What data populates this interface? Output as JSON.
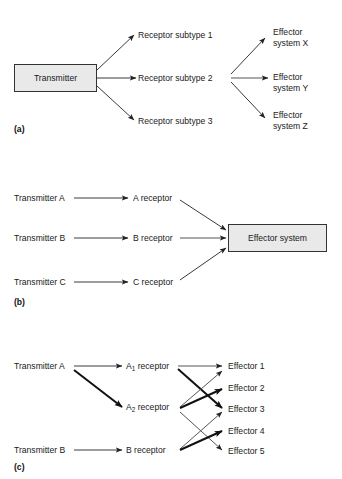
{
  "figure": {
    "background": "#ffffff",
    "text_color": "#1a1a1a",
    "box_fill": "#e9e9e9",
    "box_border": "#333333",
    "line_color_thin": "#555555",
    "line_color_thick": "#111111"
  },
  "panels": [
    {
      "tag": "(a)",
      "source": {
        "label": "Transmitter"
      },
      "receptors": [
        {
          "label": "Receptor subtype 1"
        },
        {
          "label": "Receptor subtype 2"
        },
        {
          "label": "Receptor subtype 3"
        }
      ],
      "effectors": [
        {
          "line1": "Effector",
          "line2": "system X"
        },
        {
          "line1": "Effector",
          "line2": "system Y"
        },
        {
          "line1": "Effector",
          "line2": "system Z"
        }
      ],
      "edges": [
        {
          "from": "Transmitter",
          "to": "Receptor subtype 1",
          "weight": "thin"
        },
        {
          "from": "Transmitter",
          "to": "Receptor subtype 2",
          "weight": "thin"
        },
        {
          "from": "Transmitter",
          "to": "Receptor subtype 3",
          "weight": "thin"
        },
        {
          "from": "Receptor subtype 2",
          "to": "Effector system X",
          "weight": "thin"
        },
        {
          "from": "Receptor subtype 2",
          "to": "Effector system Y",
          "weight": "thin"
        },
        {
          "from": "Receptor subtype 2",
          "to": "Effector system Z",
          "weight": "thin"
        }
      ]
    },
    {
      "tag": "(b)",
      "transmitters": [
        {
          "label": "Transmitter A"
        },
        {
          "label": "Transmitter B"
        },
        {
          "label": "Transmitter C"
        }
      ],
      "receptors": [
        {
          "label": "A receptor"
        },
        {
          "label": "B receptor"
        },
        {
          "label": "C receptor"
        }
      ],
      "effector_box": {
        "label": "Effector system"
      },
      "edges": [
        {
          "from": "Transmitter A",
          "to": "A receptor",
          "weight": "thin"
        },
        {
          "from": "Transmitter B",
          "to": "B receptor",
          "weight": "thin"
        },
        {
          "from": "Transmitter C",
          "to": "C receptor",
          "weight": "thin"
        },
        {
          "from": "A receptor",
          "to": "Effector system",
          "weight": "thin"
        },
        {
          "from": "B receptor",
          "to": "Effector system",
          "weight": "thin"
        },
        {
          "from": "C receptor",
          "to": "Effector system",
          "weight": "thin"
        }
      ]
    },
    {
      "tag": "(c)",
      "transmitters": [
        {
          "label": "Transmitter A"
        },
        {
          "label": "Transmitter B"
        }
      ],
      "receptors": [
        {
          "label_prefix": "A",
          "label_sub": "1",
          "label_suffix": " receptor"
        },
        {
          "label_prefix": "A",
          "label_sub": "2",
          "label_suffix": " receptor"
        },
        {
          "label_prefix": "B receptor",
          "label_sub": "",
          "label_suffix": ""
        }
      ],
      "effectors": [
        {
          "label": "Effector 1"
        },
        {
          "label": "Effector 2"
        },
        {
          "label": "Effector 3"
        },
        {
          "label": "Effector 4"
        },
        {
          "label": "Effector 5"
        }
      ],
      "edges": [
        {
          "from": "Transmitter A",
          "to": "A1 receptor",
          "weight": "thin"
        },
        {
          "from": "Transmitter A",
          "to": "A2 receptor",
          "weight": "thick"
        },
        {
          "from": "Transmitter B",
          "to": "B receptor",
          "weight": "thin"
        },
        {
          "from": "A1 receptor",
          "to": "Effector 1",
          "weight": "thin"
        },
        {
          "from": "A1 receptor",
          "to": "Effector 3",
          "weight": "thick"
        },
        {
          "from": "A2 receptor",
          "to": "Effector 1",
          "weight": "thin"
        },
        {
          "from": "A2 receptor",
          "to": "Effector 2",
          "weight": "thick"
        },
        {
          "from": "A2 receptor",
          "to": "Effector 5",
          "weight": "thin"
        },
        {
          "from": "B receptor",
          "to": "Effector 3",
          "weight": "thin"
        },
        {
          "from": "B receptor",
          "to": "Effector 4",
          "weight": "thick"
        }
      ]
    }
  ]
}
